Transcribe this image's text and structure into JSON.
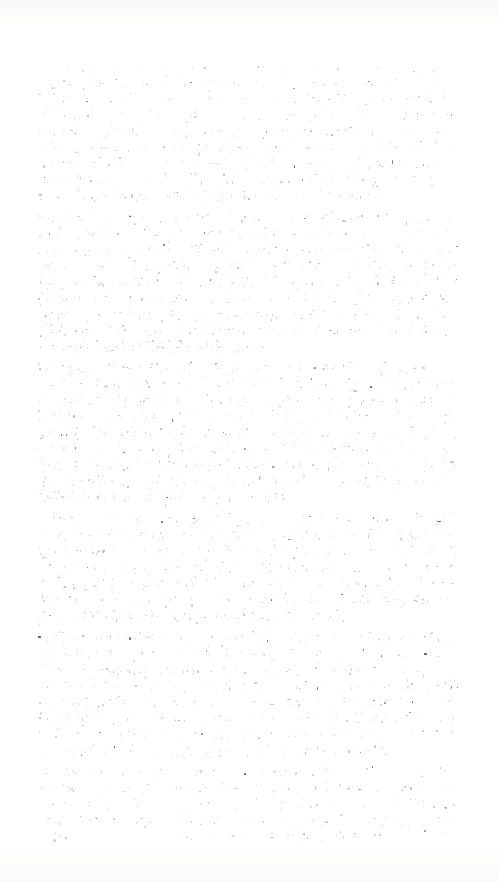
{
  "document": {
    "kind": "scanned-page",
    "condition": "severely-faded",
    "legible_text": "",
    "note_visible_on_page": "",
    "page_width": 498,
    "page_height": 882,
    "background_color": "#ffffff",
    "paper_tint_color": "#f8f8f6",
    "ink_color": "#3a3a3a"
  },
  "text_block": {
    "left": 38,
    "top": 66,
    "right": 458,
    "bottom": 842,
    "width": 420,
    "height": 776,
    "alignment": "justified",
    "line_height": 16.2,
    "line_count": 48,
    "baseline_first": 74,
    "last_line_right_edge": 440
  },
  "paragraphs": [
    {
      "start_line": 0,
      "end_line": 8,
      "indent": 0,
      "lines": 9
    },
    {
      "start_line": 9,
      "end_line": 17,
      "indent": 0,
      "lines": 9
    },
    {
      "start_line": 18,
      "end_line": 26,
      "indent": 0,
      "lines": 9
    },
    {
      "start_line": 27,
      "end_line": 33,
      "indent": 0,
      "lines": 7
    },
    {
      "start_line": 34,
      "end_line": 41,
      "indent": 0,
      "lines": 8
    },
    {
      "start_line": 42,
      "end_line": 47,
      "indent": 0,
      "lines": 6
    }
  ],
  "paragraph_gap": 5,
  "ink": {
    "speck_count_total": 2600,
    "mean_speck_size_px": 1.25,
    "max_speck_size_px": 3.5,
    "opacity_min": 0.06,
    "opacity_max": 0.82,
    "dark_speck_fraction": 0.05,
    "band_sigma_px": 3.2,
    "density_profile_description": "horizontal bands aligned to text lines; density rises toward the middle-left of the column and thins at the extreme margins"
  },
  "margins": {
    "left": 38,
    "right": 40,
    "top": 66,
    "bottom": 40
  }
}
